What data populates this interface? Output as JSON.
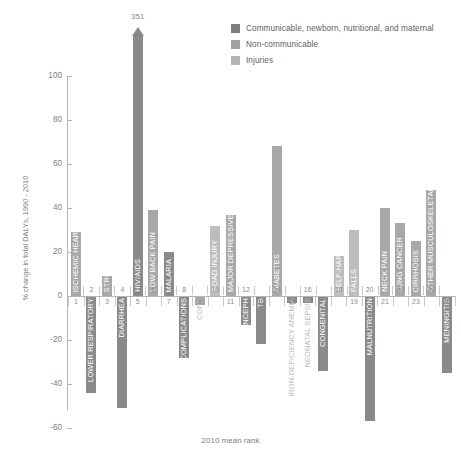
{
  "legend": {
    "items": [
      {
        "label": "Communicable, newborn, nutritional, and maternal",
        "color": "#7d7d7d"
      },
      {
        "label": "Non-communicable",
        "color": "#a0a0a0"
      },
      {
        "label": "Injuries",
        "color": "#b5b5b5"
      }
    ]
  },
  "chart_data": {
    "type": "bar",
    "title": "",
    "xlabel": "2010 mean rank",
    "ylabel": "% change in total DALYs, 1990 - 2010",
    "ylim": [
      -60,
      100
    ],
    "yticks": [
      100,
      80,
      60,
      40,
      20,
      0,
      -20,
      -40,
      -60
    ],
    "ytick_labels": [
      "100",
      "80",
      "60",
      "40",
      "20",
      "0",
      "-20",
      "-40",
      "-60"
    ],
    "grid": false,
    "legend_position": "top-right",
    "clipped_peak": {
      "rank": 5,
      "value": 351,
      "label": "351"
    },
    "categories": [
      1,
      2,
      3,
      4,
      5,
      6,
      7,
      8,
      9,
      10,
      11,
      12,
      13,
      14,
      15,
      16,
      17,
      18,
      19,
      20,
      21,
      22,
      23,
      24,
      25
    ],
    "bars": [
      {
        "rank": 1,
        "name": "ISCHEMIC HEART DISEASE",
        "value": 29,
        "group": "Non-communicable",
        "label_pos": "inside"
      },
      {
        "rank": 2,
        "name": "LOWER RESPIRATORY",
        "value": -44,
        "group": "Communicable",
        "label_pos": "inside"
      },
      {
        "rank": 3,
        "name": "STROKE",
        "value": 9,
        "group": "Non-communicable",
        "label_pos": "inside"
      },
      {
        "rank": 4,
        "name": "DIARRHEA",
        "value": -51,
        "group": "Communicable",
        "label_pos": "inside"
      },
      {
        "rank": 5,
        "name": "HIV/AIDS",
        "value": 351,
        "group": "Communicable",
        "label_pos": "inside"
      },
      {
        "rank": 6,
        "name": "LOW BACK PAIN",
        "value": 39,
        "group": "Non-communicable",
        "label_pos": "inside"
      },
      {
        "rank": 7,
        "name": "MALARIA",
        "value": 20,
        "group": "Communicable",
        "label_pos": "inside"
      },
      {
        "rank": 8,
        "name": "PRETERM COMPLICATIONS",
        "value": -28,
        "group": "Communicable",
        "label_pos": "inside"
      },
      {
        "rank": 9,
        "name": "COPD",
        "value": -4,
        "group": "Non-communicable",
        "label_pos": "outside"
      },
      {
        "rank": 10,
        "name": "ROAD INJURY",
        "value": 32,
        "group": "Injuries",
        "label_pos": "inside"
      },
      {
        "rank": 11,
        "name": "MAJOR DEPRESSIVE DISORDER",
        "value": 37,
        "group": "Non-communicable",
        "label_pos": "inside"
      },
      {
        "rank": 12,
        "name": "N. ENCEPH",
        "value": -13,
        "group": "Communicable",
        "label_pos": "inside"
      },
      {
        "rank": 13,
        "name": "TB",
        "value": -22,
        "group": "Communicable",
        "label_pos": "inside"
      },
      {
        "rank": 14,
        "name": "DIABETES",
        "value": 68,
        "group": "Non-communicable",
        "label_pos": "inside"
      },
      {
        "rank": 15,
        "name": "IRON-DEFICIENCY ANEMIA",
        "value": -3,
        "group": "Communicable",
        "label_pos": "outside"
      },
      {
        "rank": 16,
        "name": "NEONATAL SEPSIS",
        "value": -3,
        "group": "Communicable",
        "label_pos": "outside"
      },
      {
        "rank": 17,
        "name": "CONGENITAL",
        "value": -34,
        "group": "Communicable",
        "label_pos": "inside"
      },
      {
        "rank": 18,
        "name": "SELF-HARM",
        "value": 18,
        "group": "Injuries",
        "label_pos": "inside"
      },
      {
        "rank": 19,
        "name": "FALLS",
        "value": 30,
        "group": "Injuries",
        "label_pos": "inside"
      },
      {
        "rank": 20,
        "name": "MALNUTRITION",
        "value": -57,
        "group": "Communicable",
        "label_pos": "inside"
      },
      {
        "rank": 21,
        "name": "NECK PAIN",
        "value": 40,
        "group": "Non-communicable",
        "label_pos": "inside"
      },
      {
        "rank": 22,
        "name": "LUNG CANCER",
        "value": 33,
        "group": "Non-communicable",
        "label_pos": "inside"
      },
      {
        "rank": 23,
        "name": "CIRRHOSIS",
        "value": 25,
        "group": "Non-communicable",
        "label_pos": "inside"
      },
      {
        "rank": 24,
        "name": "OTHER MUSCULOSKELETAL",
        "value": 48,
        "group": "Non-communicable",
        "label_pos": "inside"
      },
      {
        "rank": 25,
        "name": "MENINGITIS",
        "value": -35,
        "group": "Communicable",
        "label_pos": "inside"
      }
    ],
    "group_colors": {
      "Communicable": "#8a8a8a",
      "Non-communicable": "#a8a8a8",
      "Injuries": "#bdbdbd"
    }
  }
}
